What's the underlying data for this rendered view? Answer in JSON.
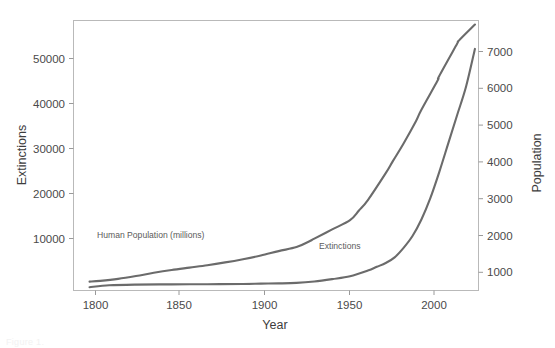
{
  "figure": {
    "background_color": "#ffffff",
    "line_color": "#6b6b6b",
    "frame_color": "#b9b9b9",
    "text_color": "#4a4a4a",
    "cropped_caption": "Figure 1."
  },
  "chart_data": {
    "type": "line",
    "title": "",
    "xlabel": "Year",
    "ylabel": "Extinctions",
    "y2label": "Population",
    "xlim": [
      1795,
      2022
    ],
    "ylim": [
      0,
      57000
    ],
    "y2lim": [
      780,
      7500
    ],
    "grid": false,
    "legend_position": "inline-annotations",
    "xticks": [
      1800,
      1850,
      1900,
      1950,
      2000
    ],
    "xtick_labels": [
      "1800",
      "1850",
      "1900",
      "1950",
      "2000"
    ],
    "yticks": [
      10000,
      20000,
      30000,
      40000,
      50000
    ],
    "ytick_labels": [
      "10000",
      "20000",
      "30000",
      "40000",
      "50000"
    ],
    "y2ticks": [
      1000,
      2000,
      3000,
      4000,
      5000,
      6000,
      7000
    ],
    "y2tick_labels": [
      "1000",
      "2000",
      "3000",
      "4000",
      "5000",
      "6000",
      "7000"
    ],
    "annotations": [
      {
        "text": "Human Population (millions)",
        "x": 1820,
        "y": 11500
      },
      {
        "text": "Extinctions",
        "x": 1952,
        "y": 9200
      }
    ],
    "series": [
      {
        "name": "Human Population (millions)",
        "axis": "right",
        "unit": "millions",
        "x": [
          1804,
          1810,
          1820,
          1830,
          1840,
          1850,
          1860,
          1870,
          1880,
          1890,
          1900,
          1910,
          1920,
          1927,
          1930,
          1940,
          1950,
          1955,
          1960,
          1970,
          1974,
          1980,
          1987,
          1990,
          1999,
          2000,
          2010,
          2011,
          2020
        ],
        "values": [
          1000,
          1020,
          1070,
          1140,
          1220,
          1290,
          1350,
          1410,
          1480,
          1560,
          1650,
          1760,
          1860,
          2000,
          2070,
          2300,
          2530,
          2770,
          3030,
          3700,
          4000,
          4440,
          5000,
          5280,
          6000,
          6120,
          6920,
          7000,
          7400
        ]
      },
      {
        "name": "Extinctions",
        "axis": "left",
        "unit": "cumulative extinctions",
        "x": [
          1804,
          1815,
          1830,
          1850,
          1870,
          1890,
          1900,
          1910,
          1920,
          1930,
          1940,
          1950,
          1960,
          1965,
          1970,
          1975,
          1980,
          1985,
          1990,
          1995,
          2000,
          2005,
          2010,
          2015,
          2020
        ],
        "values": [
          700,
          1100,
          1250,
          1300,
          1320,
          1380,
          1450,
          1500,
          1600,
          1900,
          2400,
          3000,
          4200,
          5000,
          5800,
          7000,
          9000,
          11500,
          15000,
          19500,
          25000,
          31000,
          37000,
          43000,
          51000
        ]
      }
    ]
  },
  "axes": {
    "left": {
      "title": "Extinctions"
    },
    "right": {
      "title": "Population"
    },
    "bottom": {
      "title": "Year"
    }
  }
}
